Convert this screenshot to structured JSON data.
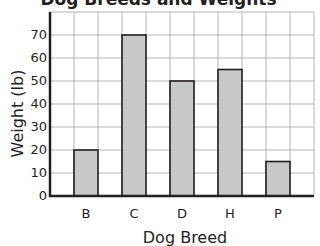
{
  "chart_data": {
    "type": "bar",
    "title": "Dog Breeds and Weights",
    "xlabel": "Dog Breed",
    "ylabel": "Weight (lb)",
    "categories": [
      "B",
      "C",
      "D",
      "H",
      "P"
    ],
    "values": [
      20,
      70,
      50,
      55,
      15
    ],
    "ylim": [
      0,
      80
    ],
    "yticks": [
      "0",
      "10",
      "20",
      "30",
      "40",
      "50",
      "60",
      "70"
    ],
    "grid": true,
    "legend": null,
    "bar_color": "#c8c8c8",
    "bar_edge_color": "#231f20"
  }
}
